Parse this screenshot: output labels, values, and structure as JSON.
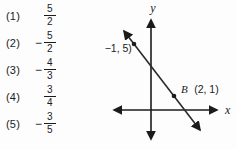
{
  "choices": [
    {
      "label": "(1)",
      "sign": "",
      "num": "5",
      "den": "2"
    },
    {
      "label": "(2)",
      "sign": "−",
      "num": "5",
      "den": "2"
    },
    {
      "label": "(3)",
      "sign": "−",
      "num": "4",
      "den": "3"
    },
    {
      "label": "(4)",
      "sign": "",
      "num": "3",
      "den": "4"
    },
    {
      "label": "(5)",
      "sign": "−",
      "num": "3",
      "den": "5"
    }
  ],
  "graph": {
    "y_axis_label": "y",
    "x_axis_label": "x",
    "point_a": {
      "name": "A",
      "coords": "(−1, 5)",
      "x": -1,
      "y": 5
    },
    "point_b": {
      "name": "B",
      "coords": "(2, 1)",
      "x": 2,
      "y": 1
    }
  },
  "colors": {
    "ink": "#1b1b1b",
    "background": "#fdfdfd"
  }
}
